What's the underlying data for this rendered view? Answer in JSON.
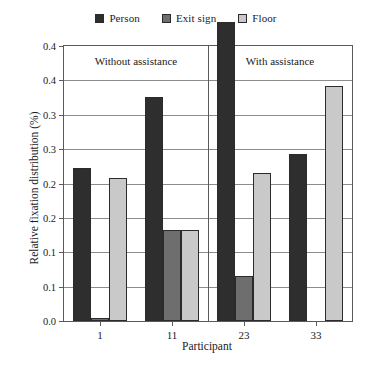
{
  "chart_data": {
    "type": "bar",
    "title": "",
    "xlabel": "Participant",
    "ylabel": "Relative fixation distribution (%)",
    "categories": [
      "1",
      "11",
      "23",
      "33"
    ],
    "series": [
      {
        "name": "Person",
        "color": "#2e2e2e",
        "values": [
          0.222,
          0.326,
          0.435,
          0.243
        ]
      },
      {
        "name": "Exit sign",
        "color": "#6e6e6e",
        "values": [
          0.005,
          0.132,
          0.066,
          0.0
        ]
      },
      {
        "name": "Floor",
        "color": "#c9c9c9",
        "values": [
          0.208,
          0.133,
          0.216,
          0.342
        ]
      }
    ],
    "ylim": [
      0,
      0.4
    ],
    "ytick_values": [
      0.0,
      0.05,
      0.1,
      0.15,
      0.2,
      0.25,
      0.3,
      0.35,
      0.4
    ],
    "ytick_labels": [
      "0.0",
      "0.1",
      "0.1",
      "0.2",
      "0.2",
      "0.3",
      "0.3",
      "0.4",
      "0.4"
    ],
    "grid": true,
    "legend_position": "top-center",
    "panels": [
      {
        "label": "Without assistance",
        "categories": [
          "1",
          "11"
        ]
      },
      {
        "label": "With assistance",
        "categories": [
          "23",
          "33"
        ]
      }
    ],
    "annotations": []
  },
  "legend": {
    "items": [
      {
        "label": "Person"
      },
      {
        "label": "Exit sign"
      },
      {
        "label": "Floor"
      }
    ]
  },
  "axes": {
    "x_title": "Participant",
    "y_title": "Relative fixation distribution (%)"
  }
}
